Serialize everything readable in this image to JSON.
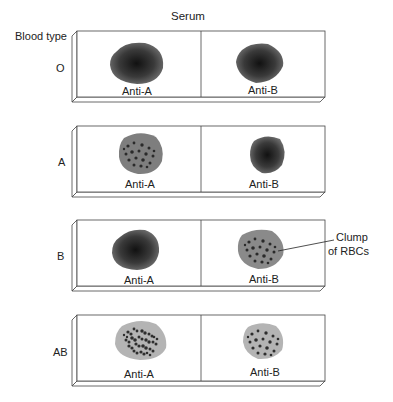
{
  "title": "Serum",
  "row_header": "Blood type",
  "columns": [
    "Anti-A",
    "Anti-B"
  ],
  "rows": [
    {
      "blood_type": "O",
      "anti_a": "no agglutination",
      "anti_b": "no agglutination"
    },
    {
      "blood_type": "A",
      "anti_a": "agglutination",
      "anti_b": "no agglutination"
    },
    {
      "blood_type": "B",
      "anti_a": "no agglutination",
      "anti_b": "agglutination"
    },
    {
      "blood_type": "AB",
      "anti_a": "agglutination",
      "anti_b": "agglutination"
    }
  ],
  "annotation": {
    "line1": "Clump",
    "line2": "of RBCs"
  },
  "labels": {
    "r0": "O",
    "r1": "A",
    "r2": "B",
    "r3": "AB",
    "antiA": "Anti-A",
    "antiB": "Anti-B"
  }
}
